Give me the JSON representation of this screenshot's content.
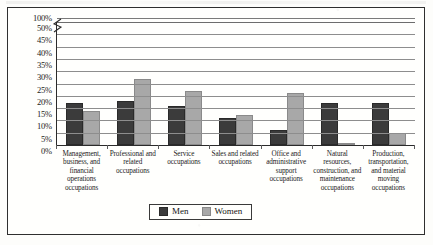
{
  "chart_data": {
    "type": "bar",
    "title": "",
    "xlabel": "",
    "ylabel": "",
    "grid": true,
    "legend_position": "bottom",
    "ylim": [
      0,
      50
    ],
    "ytick_labels": [
      "100%",
      "50%",
      "45%",
      "40%",
      "35%",
      "30%",
      "25%",
      "20%",
      "15%",
      "10%",
      "5%",
      "0%"
    ],
    "axis_break": true,
    "axis_break_note": "y-axis broken between 50% and 100%",
    "categories": [
      "Management, business, and financial operations occupations",
      "Professional and related occupations",
      "Service occupations",
      "Sales and related occupations",
      "Office and administrative support occupations",
      "Natural resources, construction, and maintenance occupations",
      "Production, transportation, and material moving occupations"
    ],
    "series": [
      {
        "name": "Men",
        "color": "#3b3b3b",
        "values": [
          17,
          18,
          16,
          11,
          6,
          17,
          17
        ]
      },
      {
        "name": "Women",
        "color": "#a8a8a8",
        "values": [
          14,
          27,
          22,
          12,
          21,
          1,
          5
        ]
      }
    ]
  },
  "legend": {
    "items": [
      {
        "label": "Men"
      },
      {
        "label": "Women"
      }
    ]
  }
}
